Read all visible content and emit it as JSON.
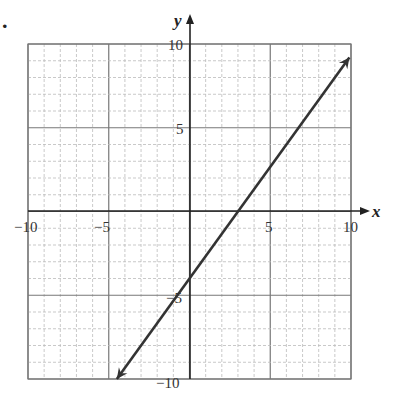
{
  "problem_marker": ".",
  "chart_data": {
    "type": "line",
    "title": "",
    "xlabel": "x",
    "ylabel": "y",
    "xlim": [
      -10,
      10
    ],
    "ylim": [
      -10,
      10
    ],
    "grid": true,
    "grid_minor_step": 1,
    "grid_major_step": 5,
    "x_tick_labels": [
      "-10",
      "-5",
      "5",
      "10"
    ],
    "y_tick_labels": [
      "10",
      "5",
      "-5",
      "-10"
    ],
    "series": [
      {
        "name": "line",
        "equation": "y = (4/3)x - 4",
        "slope": 1.333,
        "y_intercept": -4,
        "x_intercept": 3,
        "x": [
          -4.5,
          9.9
        ],
        "y": [
          -10,
          9.2
        ],
        "arrows_both_ends": true,
        "color": "#333333"
      }
    ]
  },
  "labels": {
    "x_axis": "x",
    "y_axis": "y",
    "xt_m10": "−10",
    "xt_m5": "−5",
    "xt_5": "5",
    "xt_10": "10",
    "yt_10": "10",
    "yt_5": "5",
    "yt_m5": "−5",
    "yt_m10": "−10"
  }
}
